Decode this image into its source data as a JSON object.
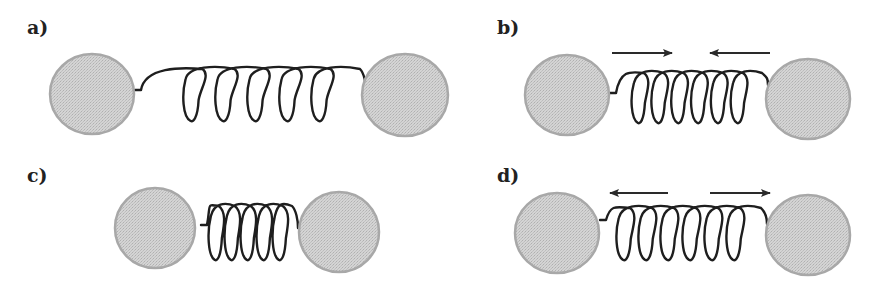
{
  "colors": {
    "ball_fill": "#cfcfcf",
    "ball_stroke": "#a8a8a8",
    "spring": "#1e1e1e",
    "arrow": "#2a2a2a",
    "label": "#222222"
  },
  "panels": [
    {
      "id": "a",
      "label": "a)",
      "label_pos": [
        27,
        16
      ],
      "state": "equilibrium",
      "balls": [
        {
          "cx": 92,
          "cy": 94,
          "rx": 42,
          "ry": 40
        },
        {
          "cx": 405,
          "cy": 95,
          "rx": 43,
          "ry": 41
        }
      ],
      "spring": {
        "x0": 135,
        "y0": 90,
        "x1": 366,
        "y1": 91,
        "loop_start": 185,
        "loop_end": 345,
        "loops": 5,
        "top": 67,
        "bottom": 121,
        "loop_width": 16
      },
      "arrows": []
    },
    {
      "id": "b",
      "label": "b)",
      "label_pos": [
        497,
        16
      ],
      "state": "stretched-restoring-inward",
      "balls": [
        {
          "cx": 567,
          "cy": 95,
          "rx": 42,
          "ry": 40
        },
        {
          "cx": 808,
          "cy": 99,
          "rx": 42,
          "ry": 40
        }
      ],
      "spring": {
        "x0": 610,
        "y0": 93,
        "x1": 768,
        "y1": 85,
        "loop_start": 633,
        "loop_end": 752,
        "loops": 6,
        "top": 71,
        "bottom": 123,
        "loop_width": 14
      },
      "arrows": [
        {
          "x1": 612,
          "x2": 672,
          "y": 53,
          "direction": "right"
        },
        {
          "x1": 770,
          "x2": 710,
          "y": 53,
          "direction": "left"
        }
      ]
    },
    {
      "id": "c",
      "label": "c)",
      "label_pos": [
        27,
        164
      ],
      "state": "compressed",
      "balls": [
        {
          "cx": 155,
          "cy": 228,
          "rx": 40,
          "ry": 40
        },
        {
          "cx": 339,
          "cy": 232,
          "rx": 40,
          "ry": 40
        }
      ],
      "spring": {
        "x0": 201,
        "y0": 225,
        "x1": 298,
        "y1": 228,
        "loop_start": 210,
        "loop_end": 290,
        "loops": 5,
        "top": 204,
        "bottom": 260,
        "loop_width": 14
      },
      "arrows": []
    },
    {
      "id": "d",
      "label": "d)",
      "label_pos": [
        497,
        164
      ],
      "state": "compressed-restoring-outward",
      "balls": [
        {
          "cx": 557,
          "cy": 233,
          "rx": 42,
          "ry": 40
        },
        {
          "cx": 808,
          "cy": 235,
          "rx": 42,
          "ry": 40
        }
      ],
      "spring": {
        "x0": 600,
        "y0": 220,
        "x1": 767,
        "y1": 224,
        "loop_start": 618,
        "loop_end": 750,
        "loops": 6,
        "top": 206,
        "bottom": 260,
        "loop_width": 15
      },
      "arrows": [
        {
          "x1": 668,
          "x2": 610,
          "y": 193,
          "direction": "left"
        },
        {
          "x1": 710,
          "x2": 770,
          "y": 193,
          "direction": "right"
        }
      ]
    }
  ]
}
